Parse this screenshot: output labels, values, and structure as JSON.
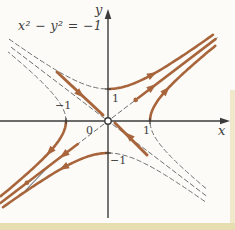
{
  "figure": {
    "labels": {
      "equation": "x² − y² = −1",
      "x_axis": "x",
      "y_axis": "y",
      "origin": "0",
      "x_tick_pos": "1",
      "x_tick_neg": "−1",
      "y_tick_pos": "1",
      "y_tick_neg": "−1"
    },
    "colors": {
      "background": "#fcfbf8",
      "axis": "#3b3b3b",
      "dashed": "#6f6f6f",
      "trajectory": "#a8653c",
      "accent_line": "#47525e",
      "label": "#3e3e3e",
      "page_edge_bottom": "#e6ddb0",
      "page_edge_right": "#efe8ca"
    },
    "origin": {
      "x": 108,
      "y": 121
    },
    "unit": {
      "x": 42,
      "y": 32
    },
    "axes": {
      "x": {
        "y": 121,
        "from": 0,
        "to": 224
      },
      "y": {
        "x": 108,
        "from": 218,
        "to": 15
      }
    },
    "ticks": [
      {
        "axis": "x",
        "value": 1
      },
      {
        "axis": "x",
        "value": -1
      },
      {
        "axis": "y",
        "value": 1
      },
      {
        "axis": "y",
        "value": -1
      }
    ],
    "curves": [
      {
        "name": "hyperbola-upper-branch-left-dashed",
        "kind": "hyp_y",
        "s": 1,
        "from": -2.35,
        "to": 0,
        "style": "dashed",
        "width": 1
      },
      {
        "name": "hyperbola-lower-branch-right-dashed",
        "kind": "hyp_y",
        "s": -1,
        "from": 0,
        "to": 2.3,
        "style": "dashed",
        "width": 1
      },
      {
        "name": "hyperbola-left-branch-upper-dashed",
        "kind": "hyp_x",
        "s": -1,
        "from": 0,
        "to": 2.15,
        "style": "dashed",
        "width": 1
      },
      {
        "name": "hyperbola-right-branch-lower-dashed",
        "kind": "hyp_x",
        "s": 1,
        "from": -2.1,
        "to": 0,
        "style": "dashed",
        "width": 1
      },
      {
        "name": "asymptote-y-equals-minus-x-dashed",
        "kind": "line_math",
        "from": [
          -2.3,
          2.3
        ],
        "to": [
          2.35,
          -2.35
        ],
        "style": "dashed",
        "width": 1
      },
      {
        "name": "asymptote-y-equals-x-dashed",
        "kind": "line_math",
        "from": [
          -2.6,
          -2.6
        ],
        "to": [
          2.6,
          2.6
        ],
        "style": "dashed",
        "width": 1
      },
      {
        "name": "separatrix-line-lower-left",
        "kind": "line_screen",
        "from": [
          20,
          196
        ],
        "to": [
          54,
          161
        ],
        "style": "solid",
        "width": 1,
        "color": "accent"
      },
      {
        "name": "trajectory-upper-branch-right",
        "kind": "hyp_y",
        "s": 1,
        "from": 0,
        "to": 2.5,
        "style": "solid",
        "width": 2.6
      },
      {
        "name": "trajectory-right-branch-upper",
        "kind": "hyp_x",
        "s": 1,
        "from": 0,
        "to": 2.35,
        "style": "solid",
        "width": 2.6
      },
      {
        "name": "trajectory-lower-branch-left",
        "kind": "hyp_y",
        "s": -1,
        "from": -2.5,
        "to": 0,
        "style": "solid",
        "width": 2.6
      },
      {
        "name": "trajectory-left-branch-lower",
        "kind": "hyp_x",
        "s": -1,
        "from": -2.35,
        "to": 0,
        "style": "solid",
        "width": 2.6
      },
      {
        "name": "trajectory-outgoing-asymptote-upper-right",
        "kind": "line_math",
        "from": [
          0.72,
          0.72
        ],
        "to": [
          2.56,
          2.56
        ],
        "style": "solid",
        "width": 2.6
      },
      {
        "name": "trajectory-outgoing-asymptote-lower-left",
        "kind": "line_math",
        "from": [
          -2.56,
          -2.56
        ],
        "to": [
          -0.72,
          -0.72
        ],
        "style": "solid",
        "width": 2.6
      },
      {
        "name": "trajectory-incoming-upper-left",
        "kind": "line_screen",
        "from": [
          57,
          72
        ],
        "to": [
          103,
          115
        ],
        "style": "solid",
        "width": 3
      },
      {
        "name": "trajectory-incoming-lower-right",
        "kind": "line_screen",
        "from": [
          147,
          155
        ],
        "to": [
          115,
          123
        ],
        "style": "solid",
        "width": 3
      }
    ],
    "arrows": [
      {
        "name": "arrow-upper-branch",
        "x": 152,
        "y": 74.6,
        "angle": -29
      },
      {
        "name": "arrow-asymptote-upper-right",
        "x": 152,
        "y": 87.4,
        "angle": -37
      },
      {
        "name": "arrow-right-branch",
        "x": 166,
        "y": 90.6,
        "angle": -48
      },
      {
        "name": "arrow-lower-branch",
        "x": 64,
        "y": 167.4,
        "angle": 151
      },
      {
        "name": "arrow-asymptote-lower-left",
        "x": 64,
        "y": 154.6,
        "angle": 143
      },
      {
        "name": "arrow-left-branch",
        "x": 50,
        "y": 151.4,
        "angle": 132
      },
      {
        "name": "arrow-incoming-upper-left",
        "x": 80,
        "y": 94,
        "angle": 43
      },
      {
        "name": "arrow-incoming-lower-right",
        "x": 129,
        "y": 136,
        "angle": 223
      }
    ],
    "dots": [
      {
        "name": "dot-asymptote-upper-right",
        "x": 135.7,
        "y": 99.9
      },
      {
        "name": "dot-asymptote-lower-left",
        "x": 26.9,
        "y": 182.8
      }
    ],
    "origin_marker": {
      "r": 3.2
    }
  },
  "chart_data": {
    "type": "line",
    "title": "x² − y² = −1",
    "xlabel": "x",
    "ylabel": "y",
    "xlim": [
      -2.6,
      3.0
    ],
    "ylim": [
      -3.3,
      3.3
    ],
    "x_ticks": [
      -1,
      0,
      1
    ],
    "y_ticks": [
      -1,
      1
    ],
    "grid": false,
    "legend": false,
    "series": [
      {
        "name": "hyperbola x² − y² = −1 (upper/lower branches)",
        "equation": "y = ±√(1+x²)",
        "style": "half solid brown trajectory, half thin dashed"
      },
      {
        "name": "hyperbola x² − y² = 1 (left/right branches)",
        "equation": "x = ±√(1+y²)",
        "style": "half solid brown trajectory, half thin dashed"
      },
      {
        "name": "asymptote y = x",
        "equation": "y = x",
        "style": "dashed near origin, solid brown outgoing trajectory with arrows"
      },
      {
        "name": "asymptote y = −x",
        "equation": "y = −x",
        "style": "dashed, with solid brown incoming arrow segments near origin"
      }
    ],
    "annotations": [
      "arrows point away from origin along y = x (upper-right and lower-left)",
      "arrows point toward origin along y = −x (from upper-left and lower-right)",
      "open circle marks the saddle equilibrium at the origin"
    ]
  }
}
